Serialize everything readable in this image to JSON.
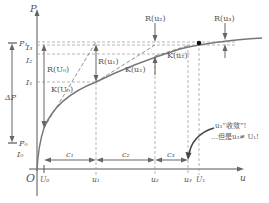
{
  "axes": {
    "y_label": "P",
    "x_label": "u",
    "origin_label": "O"
  },
  "y_ticks": {
    "P1": "P₁",
    "I3": "I₃",
    "I2": "I₂",
    "I1": "I₁",
    "delta_P": "ΔP",
    "P0": "P₀",
    "I0": "I₀"
  },
  "x_ticks": {
    "U0": "U₀",
    "u1": "u₁",
    "u2": "u₂",
    "u3": "u₃",
    "U1": "U₁"
  },
  "residual_labels": {
    "R_U0": "R(U₀)",
    "R_u1": "R(u₁)",
    "R_u2": "R(u₂)",
    "R_u3": "R(u₃)"
  },
  "tangent_labels": {
    "K_U0": "K(U₀)",
    "K_u1": "K(u₁)",
    "K_u2": "K(u₂)"
  },
  "step_labels": {
    "c1": "c₁",
    "c2": "c₂",
    "c3": "c₃"
  },
  "annotation": {
    "line1": "u₃“收敛”!",
    "line2": "…但是u₃≠ U₁!"
  }
}
